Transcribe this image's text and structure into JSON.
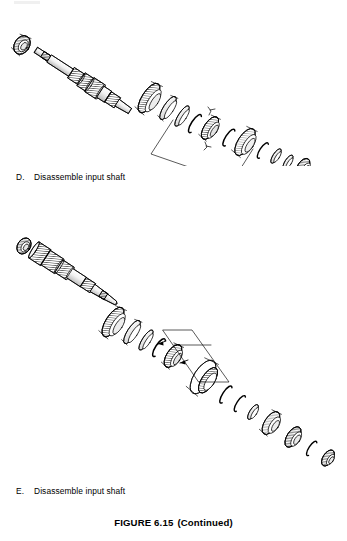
{
  "page": {
    "background_color": "#ffffff",
    "line_color": "#000000",
    "shade_color": "#9a9a9a"
  },
  "steps": [
    {
      "letter": "D.",
      "text": "Disassemble input shaft",
      "diagram_name": "exploded-input-shaft-diagram-d"
    },
    {
      "letter": "E.",
      "text": "Disassemble input shaft",
      "diagram_name": "exploded-input-shaft-diagram-e"
    }
  ],
  "figure_caption": {
    "label": "FIGURE 6.15",
    "continued": "(Continued)"
  },
  "diagram_d": {
    "description": "Exploded view of transmission input shaft assembly with bearing, splined shaft, gears, synchronizer rings, snap rings and bearings arranged diagonally",
    "parts_count": 16,
    "callout_box": "parallelogram leader frame around synchronizer hub"
  },
  "diagram_e": {
    "description": "Exploded view of transmission input shaft assembly, second orientation, with bearing, geared shaft, synchronizer assemblies, snap rings and bearings arranged diagonally",
    "parts_count": 18,
    "callout_box": "parallelogram leader frame with two arrows pointing to synchronizer components"
  }
}
